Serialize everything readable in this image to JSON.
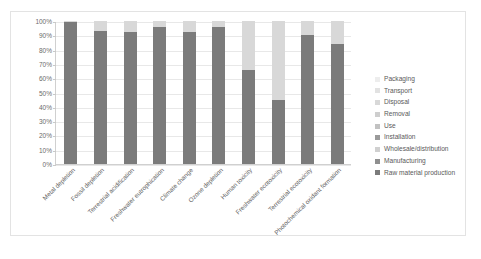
{
  "chart_data": {
    "type": "bar",
    "subtype": "stacked-percentage",
    "title": "",
    "xlabel": "",
    "ylabel": "",
    "ylim": [
      0,
      100
    ],
    "ytick_labels": [
      "100%",
      "90%",
      "80%",
      "70%",
      "60%",
      "50%",
      "40%",
      "30%",
      "20%",
      "10%",
      "0%"
    ],
    "ytick_values": [
      100,
      90,
      80,
      70,
      60,
      50,
      40,
      30,
      20,
      10,
      0
    ],
    "grid": true,
    "legend_position": "right",
    "categories": [
      "Metal depletion",
      "Fossil depletion",
      "Terrestrial acidification",
      "Freshwater eutrophication",
      "Climate change",
      "Ozone depletion",
      "Human toxicity",
      "Freshwater ecotoxicity",
      "Terrestrial ecotoxicity",
      "Photochemical oxidant formation"
    ],
    "series": [
      {
        "name": "Raw material production",
        "color": "#7b7b7b",
        "values": [
          99,
          93,
          92,
          96,
          92,
          96,
          66,
          45,
          90,
          84
        ]
      },
      {
        "name": "Manufacturing",
        "color": "#8f8f8f",
        "values": [
          0,
          0,
          0,
          0,
          0,
          0,
          0,
          0,
          0,
          0
        ]
      },
      {
        "name": "Wholesale/distribution",
        "color": "#a6a6a6",
        "values": [
          0,
          0,
          0,
          0,
          0,
          0,
          0,
          0,
          0,
          0
        ]
      },
      {
        "name": "Installation",
        "color": "#b5b5b5",
        "values": [
          0,
          0,
          0,
          0,
          0,
          0,
          0,
          0,
          0,
          0
        ]
      },
      {
        "name": "Use",
        "color": "#c2c2c2",
        "values": [
          0,
          0,
          0,
          0,
          0,
          0,
          0,
          0,
          0,
          0
        ]
      },
      {
        "name": "Removal",
        "color": "#cecece",
        "values": [
          0,
          0,
          0,
          0,
          0,
          0,
          0,
          0,
          0,
          0
        ]
      },
      {
        "name": "Disposal",
        "color": "#d8d8d8",
        "values": [
          1,
          7,
          8,
          4,
          8,
          4,
          34,
          55,
          10,
          16
        ]
      },
      {
        "name": "Transport",
        "color": "#e2e2e2",
        "values": [
          0,
          0,
          0,
          0,
          0,
          0,
          0,
          0,
          0,
          0
        ]
      },
      {
        "name": "Packaging",
        "color": "#ededed",
        "values": [
          0,
          0,
          0,
          0,
          0,
          0,
          0,
          0,
          0,
          0
        ]
      }
    ],
    "legend_entries": [
      {
        "label": "Packaging",
        "color": "#ededed"
      },
      {
        "label": "Transport",
        "color": "#e2e2e2"
      },
      {
        "label": "Disposal",
        "color": "#d8d8d8"
      },
      {
        "label": "Removal",
        "color": "#cecece"
      },
      {
        "label": "Use",
        "color": "#c2c2c2"
      },
      {
        "label": "Installation",
        "color": "#9a9a9a"
      },
      {
        "label": "Wholesale/distribution",
        "color": "#d0d0d0"
      },
      {
        "label": "Manufacturing",
        "color": "#8f8f8f"
      },
      {
        "label": "Raw material production",
        "color": "#7b7b7b"
      }
    ]
  }
}
